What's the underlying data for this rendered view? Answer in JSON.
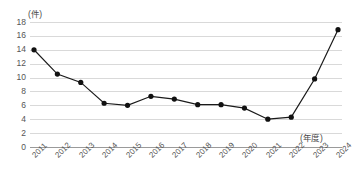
{
  "chart_data": {
    "type": "line",
    "title": "",
    "xlabel": "(年度)",
    "ylabel": "(件)",
    "categories": [
      "2011",
      "2012",
      "2013",
      "2014",
      "2015",
      "2016",
      "2017",
      "2018",
      "2019",
      "2020",
      "2021",
      "2022",
      "2023",
      "2024"
    ],
    "values": [
      14,
      10.5,
      9.3,
      6.3,
      6,
      7.3,
      6.9,
      6.1,
      6.1,
      5.6,
      4,
      4.3,
      9.8,
      16.9
    ],
    "series": [
      {
        "name": "件数",
        "values": [
          14,
          10.5,
          9.3,
          6.3,
          6,
          7.3,
          6.9,
          6.1,
          6.1,
          5.6,
          4,
          4.3,
          9.8,
          16.9
        ]
      }
    ],
    "ylim": [
      0,
      18
    ],
    "ytick_labels": [
      "18",
      "16",
      "14",
      "12",
      "10",
      "8",
      "6",
      "4",
      "2",
      "0"
    ],
    "ytick_values": [
      18,
      16,
      14,
      12,
      10,
      8,
      6,
      4,
      2,
      0
    ],
    "ystep": 2,
    "grid": true,
    "legend": "none",
    "marker": "circle",
    "line_color": "#1a1a1a",
    "marker_color": "#111111",
    "grid_color": "#d9d9d9",
    "axis_color": "#9a9a9a"
  }
}
